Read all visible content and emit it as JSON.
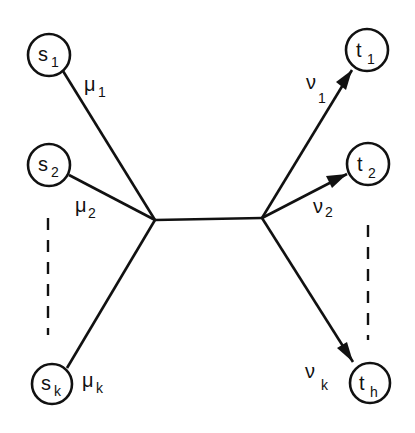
{
  "diagram": {
    "type": "flow-network",
    "colors": {
      "ink": "#111111",
      "background": "#ffffff"
    },
    "sources": [
      {
        "id": "s1",
        "base": "s",
        "sub": "1",
        "cx": 49,
        "cy": 55,
        "r": 21
      },
      {
        "id": "s2",
        "base": "s",
        "sub": "2",
        "cx": 49,
        "cy": 165,
        "r": 21
      },
      {
        "id": "sk",
        "base": "s",
        "sub": "k",
        "cx": 52,
        "cy": 384,
        "r": 20
      }
    ],
    "sinks": [
      {
        "id": "t1",
        "base": "t",
        "sub": "1",
        "cx": 367,
        "cy": 50,
        "r": 21
      },
      {
        "id": "t2",
        "base": "t",
        "sub": "2",
        "cx": 368,
        "cy": 164,
        "r": 21
      },
      {
        "id": "th",
        "base": "t",
        "sub": "h",
        "cx": 370,
        "cy": 383,
        "r": 20
      }
    ],
    "junctions": {
      "left": {
        "x": 155,
        "y": 220
      },
      "right": {
        "x": 262,
        "y": 218
      }
    },
    "source_edges": [
      {
        "from": "s1",
        "label_base": "μ",
        "label_sub": "1"
      },
      {
        "from": "s2",
        "label_base": "μ",
        "label_sub": "2"
      },
      {
        "from": "sk",
        "label_base": "μ",
        "label_sub": "k"
      }
    ],
    "sink_edges": [
      {
        "to": "t1",
        "label_base": "ν",
        "label_sub": "1",
        "arrow": true
      },
      {
        "to": "t2",
        "label_base": "ν",
        "label_sub": "2",
        "arrow": true
      },
      {
        "to": "th",
        "label_base": "ν",
        "label_sub": "k",
        "arrow": true
      }
    ],
    "ellipsis": {
      "left": {
        "x": 48,
        "y1": 218,
        "y2": 335,
        "style": "dashed"
      },
      "right": {
        "x": 368,
        "y1": 225,
        "y2": 340,
        "style": "dashed"
      }
    }
  }
}
